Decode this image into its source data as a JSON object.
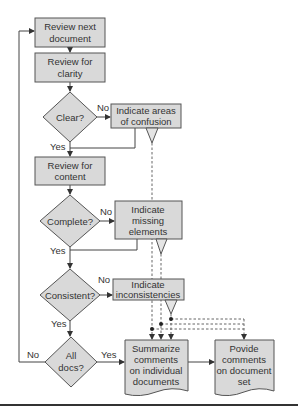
{
  "colors": {
    "box_fill": "#d9d9d9",
    "box_stroke": "#555555",
    "line": "#444444",
    "text": "#333333",
    "background": "#ffffff"
  },
  "nodes": {
    "review_next": {
      "line1": "Review next",
      "line2": "document"
    },
    "review_clarity": {
      "line1": "Review for",
      "line2": "clarity"
    },
    "clear": {
      "label": "Clear?"
    },
    "areas_confusion": {
      "line1": "Indicate areas",
      "line2": "of confusion"
    },
    "review_content": {
      "line1": "Review for",
      "line2": "content"
    },
    "complete": {
      "label": "Complete?"
    },
    "missing": {
      "line1": "Indicate",
      "line2": "missing",
      "line3": "elements"
    },
    "consistent": {
      "label": "Consistent?"
    },
    "inconsistencies": {
      "line1": "Indicate",
      "line2": "inconsistencies"
    },
    "all_docs": {
      "line1": "All",
      "line2": "docs?"
    },
    "summarize": {
      "line1": "Summarize",
      "line2": "comments",
      "line3": "on individual",
      "line4": "documents"
    },
    "provide": {
      "line1": "Povide",
      "line2": "comments",
      "line3": "on document",
      "line4": "set"
    }
  },
  "edges": {
    "clear_no": "No",
    "clear_yes": "Yes",
    "complete_no": "No",
    "complete_yes": "Yes",
    "consistent_no": "No",
    "consistent_yes": "Yes",
    "alldocs_no": "No",
    "alldocs_yes": "Yes"
  }
}
